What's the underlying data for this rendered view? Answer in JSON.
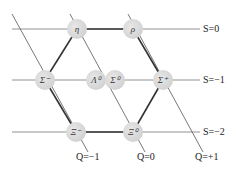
{
  "diagram": {
    "strangeness_labels": [
      "S=0",
      "S=−1",
      "S=−2"
    ],
    "charge_labels": [
      "Q=−1",
      "Q=0",
      "Q=+1"
    ],
    "particles": [
      {
        "id": "eta",
        "symbol": "η",
        "x": 77,
        "y": 29
      },
      {
        "id": "rho",
        "symbol": "ρ",
        "x": 133,
        "y": 29
      },
      {
        "id": "sigma-minus",
        "symbol": "Σ⁻",
        "x": 45,
        "y": 80
      },
      {
        "id": "lambda0",
        "symbol": "Λ⁰",
        "x": 96,
        "y": 80
      },
      {
        "id": "sigma0",
        "symbol": "Σ⁰",
        "x": 115,
        "y": 80
      },
      {
        "id": "sigma-plus",
        "symbol": "Σ⁺",
        "x": 163,
        "y": 80
      },
      {
        "id": "xi-minus",
        "symbol": "Ξ⁻",
        "x": 76,
        "y": 132
      },
      {
        "id": "xi0",
        "symbol": "Ξ⁰",
        "x": 133,
        "y": 132
      }
    ],
    "colors": {
      "line": "#555555",
      "thick_line": "#333333",
      "node": "#d4d4d4"
    }
  }
}
